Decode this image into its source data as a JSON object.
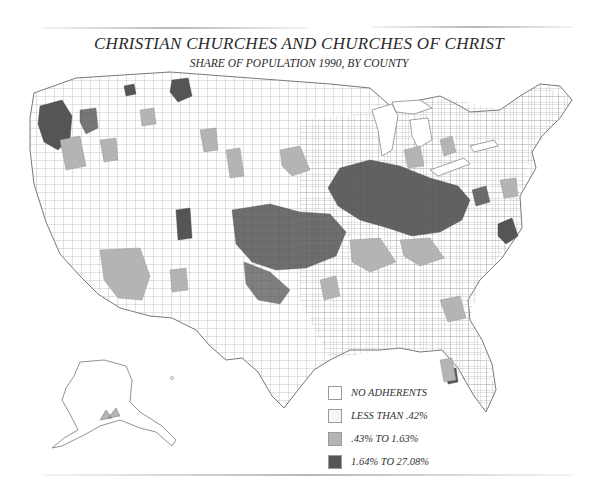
{
  "title": "CHRISTIAN CHURCHES AND CHURCHES OF CHRIST",
  "subtitle": "SHARE OF POPULATION 1990, BY COUNTY",
  "legend": {
    "items": [
      {
        "label": "NO ADHERENTS",
        "color": "#ffffff"
      },
      {
        "label": "LESS THAN .42%",
        "color": "#f6f6f6"
      },
      {
        "label": ".43% TO 1.63%",
        "color": "#b4b4b4"
      },
      {
        "label": "1.64% TO 27.08%",
        "color": "#555555"
      }
    ]
  },
  "colors": {
    "outline": "#8a8a8a",
    "none": "#ffffff",
    "low": "#f6f6f6",
    "mid": "#b4b4b4",
    "high": "#555555"
  },
  "map": {
    "region": "United States (contiguous) with Alaska inset",
    "concentration": "Highest shares in Midwest (IL, IN, MO, KY, OH), Kansas/Oklahoma, Pacific Northwest, Montana, Utah"
  }
}
